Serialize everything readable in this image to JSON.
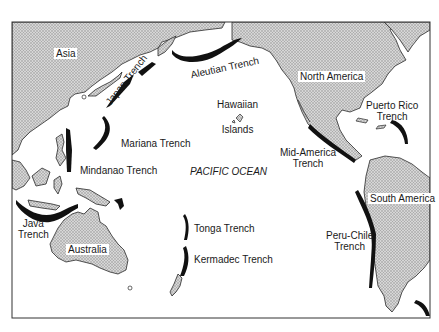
{
  "map": {
    "title": "Pacific Ocean Trenches",
    "colors": {
      "land_fill": "#c8c8c8",
      "land_stroke": "#2a2a2a",
      "trench": "#111111",
      "ocean": "#ffffff",
      "frame": "#333333"
    },
    "continents": [
      {
        "id": "asia",
        "label": "Asia"
      },
      {
        "id": "north-america",
        "label": "North America"
      },
      {
        "id": "south-america",
        "label": "South America"
      },
      {
        "id": "australia",
        "label": "Australia"
      }
    ],
    "ocean_label": "PACIFIC OCEAN",
    "islands": [
      {
        "id": "hawaiian",
        "label_line1": "Hawaiian",
        "label_line2": "Islands"
      }
    ],
    "trenches": [
      {
        "id": "aleutian",
        "label": "Aleutian Trench"
      },
      {
        "id": "japan",
        "label": "Japan Trench"
      },
      {
        "id": "mariana",
        "label": "Mariana Trench"
      },
      {
        "id": "mindanao",
        "label": "Mindanao Trench"
      },
      {
        "id": "java",
        "label_line1": "Java",
        "label_line2": "Trench"
      },
      {
        "id": "tonga",
        "label": "Tonga Trench"
      },
      {
        "id": "kermadec",
        "label": "Kermadec Trench"
      },
      {
        "id": "mid-america",
        "label_line1": "Mid-America",
        "label_line2": "Trench"
      },
      {
        "id": "puerto-rico",
        "label_line1": "Puerto Rico",
        "label_line2": "Trench"
      },
      {
        "id": "peru-chile",
        "label_line1": "Peru-Chile",
        "label_line2": "Trench"
      }
    ]
  }
}
